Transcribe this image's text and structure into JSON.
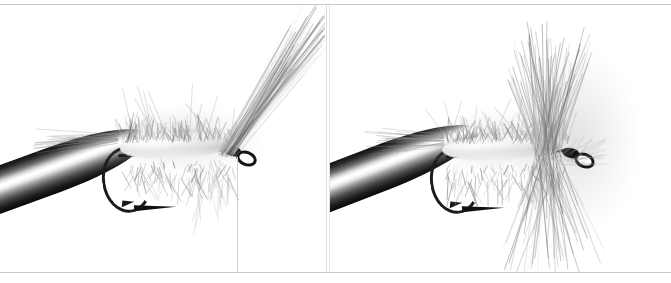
{
  "page": {
    "background_color": "#ffffff",
    "rule_color": "#c9c9c9",
    "width": 671,
    "height": 283
  },
  "panels": [
    {
      "id": "panel-left",
      "name": "left-photo-panel",
      "description": "Close-up photograph of a fly hook clamped in a vise with a shaggy dubbed body and a long swept-back wing of fibers angling toward the upper right",
      "subject": "tied fly on hook in vise",
      "orientation": "hook eye to the right",
      "elements": {
        "vise_jaw": "metal vise jaw entering from lower left with bright specular highlight",
        "hook": "down-eye dry fly hook, dark blued finish, point and barb visible below",
        "body": "light grey shaggy dubbed body along the shank",
        "wing": "long translucent swept-back fiber wing angled up and to the right",
        "tail": "fine fibers trailing to the left",
        "thread": "tying thread hanging vertically behind the hook eye"
      },
      "tones": {
        "darkest": "#0a0a0a",
        "midtone": "#8c8c8c",
        "lightest": "#ffffff"
      }
    },
    {
      "id": "panel-right",
      "name": "right-photo-panel",
      "description": "Close-up photograph of the same fly after a hackle collar has been wound at the head, fibers radiating up and down",
      "subject": "tied fly on hook in vise with hackle collar",
      "orientation": "hook eye to the right",
      "elements": {
        "vise_jaw": "metal vise jaw entering from lower left with bright specular highlight",
        "hook": "down-eye dry fly hook, dark blued finish, point and barb visible below",
        "body": "light grey shaggy dubbed body along the shank",
        "hackle": "dense grey hackle collar radiating above and below just behind the head",
        "tail": "fine fibers trailing to the left"
      },
      "tones": {
        "darkest": "#0a0a0a",
        "midtone": "#8c8c8c",
        "lightest": "#ffffff"
      }
    }
  ],
  "dividers": {
    "vertical_line_color": "#dcdcdc",
    "count": 2
  }
}
